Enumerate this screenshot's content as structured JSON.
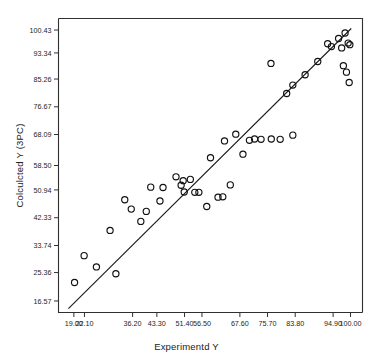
{
  "chart_data": {
    "type": "scatter",
    "title": "",
    "xlabel": "Experimentd Y",
    "ylabel": "Colculcted Y (3PC)",
    "grid": false,
    "legend": null,
    "xlim": [
      14.5,
      103.5
    ],
    "ylim": [
      13.0,
      104.0
    ],
    "xticks": [
      "19.00",
      "22.10",
      "36.20",
      "43.30",
      "51.40",
      "56.50",
      "67.60",
      "75.70",
      "83.80",
      "94.90",
      "100.00"
    ],
    "xtick_values": [
      19.0,
      22.1,
      36.2,
      43.3,
      51.4,
      56.5,
      67.6,
      75.7,
      83.8,
      94.9,
      100.0
    ],
    "yticks": [
      "16.57",
      "25.36",
      "33.74",
      "42.33",
      "50.94",
      "58.50",
      "68.09",
      "76.67",
      "85.26",
      "93.34",
      "100.43"
    ],
    "ytick_values": [
      16.57,
      25.36,
      33.74,
      42.33,
      50.94,
      58.5,
      68.09,
      76.67,
      85.26,
      93.34,
      100.43
    ],
    "series": [
      {
        "name": "observations",
        "marker": "open-circle",
        "points": [
          [
            19.2,
            22.3
          ],
          [
            22.0,
            30.6
          ],
          [
            25.6,
            27.1
          ],
          [
            31.3,
            25.0
          ],
          [
            29.6,
            38.4
          ],
          [
            33.9,
            47.9
          ],
          [
            35.8,
            45.0
          ],
          [
            38.6,
            41.2
          ],
          [
            40.2,
            44.3
          ],
          [
            41.5,
            51.8
          ],
          [
            44.2,
            47.5
          ],
          [
            45.1,
            51.7
          ],
          [
            48.9,
            55.0
          ],
          [
            50.4,
            52.4
          ],
          [
            51.3,
            50.3
          ],
          [
            51.0,
            53.8
          ],
          [
            53.1,
            54.2
          ],
          [
            54.4,
            50.2
          ],
          [
            55.6,
            50.2
          ],
          [
            57.9,
            45.8
          ],
          [
            59.0,
            60.9
          ],
          [
            61.2,
            48.7
          ],
          [
            62.6,
            48.8
          ],
          [
            64.8,
            52.5
          ],
          [
            63.1,
            66.1
          ],
          [
            66.4,
            68.2
          ],
          [
            68.5,
            62.0
          ],
          [
            70.4,
            66.3
          ],
          [
            71.9,
            66.7
          ],
          [
            73.8,
            66.6
          ],
          [
            76.8,
            66.7
          ],
          [
            79.4,
            66.6
          ],
          [
            83.1,
            67.9
          ],
          [
            76.7,
            90.1
          ],
          [
            81.3,
            80.8
          ],
          [
            83.1,
            83.4
          ],
          [
            86.7,
            86.6
          ],
          [
            90.4,
            90.7
          ],
          [
            93.3,
            96.2
          ],
          [
            94.4,
            95.3
          ],
          [
            96.5,
            97.8
          ],
          [
            97.4,
            94.9
          ],
          [
            98.4,
            99.5
          ],
          [
            97.9,
            89.4
          ],
          [
            98.8,
            87.4
          ],
          [
            99.6,
            84.2
          ],
          [
            99.3,
            96.4
          ],
          [
            99.8,
            95.9
          ]
        ]
      }
    ],
    "fit_line": {
      "name": "regression-line",
      "x_start": 17.4,
      "y_start": 14.2,
      "x_end": 100.2,
      "y_end": 100.9
    }
  }
}
